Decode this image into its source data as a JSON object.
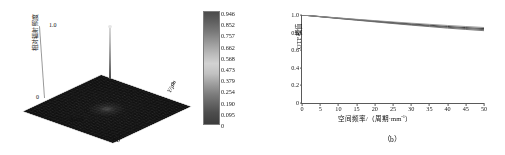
{
  "figure": {
    "background": "#ffffff",
    "panels": [
      "a",
      "b"
    ]
  },
  "panel_a": {
    "caption": "（a）",
    "zaxis": {
      "label": "相对辐射照度",
      "ticks": [
        "1.0",
        "0"
      ]
    },
    "xaxis": {
      "label": "X/µm",
      "ticks": [
        "0"
      ]
    },
    "yaxis": {
      "label": "Y/µm",
      "ticks": [
        "0"
      ]
    },
    "colorbar": {
      "ticks": [
        "0.946",
        "0.852",
        "0.757",
        "0.662",
        "0.568",
        "0.473",
        "0.379",
        "0.254",
        "0.190",
        "0.095",
        "0"
      ],
      "top_color": "#4b4b4b",
      "mid_color": "#d2d2d2",
      "bottom_color": "#3c3c3c"
    },
    "chart_data": {
      "type": "heatmap",
      "title": "",
      "xlabel": "X/µm",
      "ylabel": "Y/µm",
      "zlabel": "相对辐射照度",
      "zlim": [
        0,
        1.0
      ],
      "ztick_labels": [
        "1.0",
        "0"
      ],
      "colorbar_range": [
        0,
        0.946
      ],
      "colorbar_ticks": [
        0,
        0.095,
        0.19,
        0.254,
        0.379,
        0.473,
        0.568,
        0.662,
        0.757,
        0.852,
        0.946
      ],
      "description": "三维点扩散函数曲面：平坦的暗背景中心有一条细高的尖峰",
      "peak": {
        "x": 0,
        "y": 0,
        "value": 0.946
      },
      "background_level": 0.0,
      "grid": false,
      "legend": "none"
    }
  },
  "panel_b": {
    "caption": "（b）",
    "xaxis": {
      "label_prefix": "空间频率/（周期·mm",
      "label_sup": "-1",
      "label_suffix": "）",
      "ticks": [
        "0",
        "5",
        "10",
        "15",
        "20",
        "25",
        "30",
        "35",
        "40",
        "45",
        "50"
      ]
    },
    "yaxis": {
      "label": "OTF模值",
      "ticks": [
        "1.0",
        "0.8",
        "0.6",
        "0.4",
        "0.2",
        "0"
      ]
    },
    "chart_data": {
      "type": "line",
      "title": "",
      "xlabel": "空间频率/（周期·mm⁻¹）",
      "ylabel": "OTF模值",
      "xlim": [
        0,
        50
      ],
      "ylim": [
        0,
        1.0
      ],
      "xticks": [
        0,
        5,
        10,
        15,
        20,
        25,
        30,
        35,
        40,
        45,
        50
      ],
      "yticks": [
        0,
        0.2,
        0.4,
        0.6,
        0.8,
        1.0
      ],
      "grid": false,
      "legend": "none",
      "x": [
        0,
        5,
        10,
        15,
        20,
        25,
        30,
        35,
        40,
        45,
        50
      ],
      "series": [
        {
          "name": "曲线1",
          "color": "#2b2b2b",
          "values": [
            1.0,
            0.982,
            0.965,
            0.948,
            0.931,
            0.915,
            0.899,
            0.884,
            0.87,
            0.857,
            0.846
          ]
        },
        {
          "name": "曲线2",
          "color": "#4a4a4a",
          "values": [
            1.0,
            0.981,
            0.962,
            0.944,
            0.926,
            0.908,
            0.891,
            0.875,
            0.86,
            0.846,
            0.834
          ]
        },
        {
          "name": "曲线3",
          "color": "#6b6b6b",
          "values": [
            1.0,
            0.98,
            0.96,
            0.941,
            0.922,
            0.903,
            0.885,
            0.868,
            0.851,
            0.836,
            0.822
          ]
        },
        {
          "name": "曲线4",
          "color": "#8d8d8d",
          "values": [
            1.0,
            0.983,
            0.967,
            0.951,
            0.936,
            0.921,
            0.907,
            0.894,
            0.881,
            0.869,
            0.858
          ]
        }
      ]
    }
  }
}
